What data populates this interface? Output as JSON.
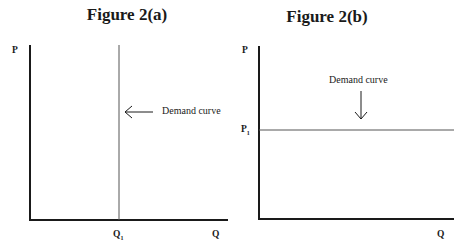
{
  "figures": [
    {
      "title": "Figure 2(a)",
      "y_axis_label": "P",
      "x_axis_label": "Q",
      "x_marker_label": "Q",
      "x_marker_sub": "1",
      "annotation": "Demand curve",
      "arrow_direction": "left",
      "curve_type": "vertical (perfectly inelastic)"
    },
    {
      "title": "Figure 2(b)",
      "y_axis_label": "P",
      "x_axis_label": "Q",
      "y_marker_label": "P",
      "y_marker_sub": "1",
      "annotation": "Demand curve",
      "arrow_direction": "down",
      "curve_type": "horizontal (perfectly elastic)"
    }
  ],
  "colors": {
    "axis": "#1a1a1a",
    "curve": "#555555",
    "text": "#1a1a1a"
  }
}
